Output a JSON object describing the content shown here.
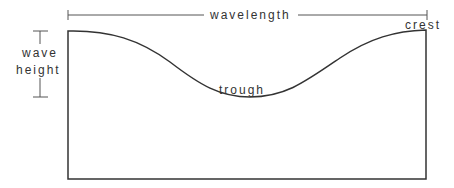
{
  "diagram": {
    "labels": {
      "wavelength": "wavelength",
      "crest": "crest",
      "trough": "trough",
      "wave_height_line1": "wave",
      "wave_height_line2": "height"
    },
    "colors": {
      "stroke": "#333333",
      "background": "#ffffff"
    }
  }
}
